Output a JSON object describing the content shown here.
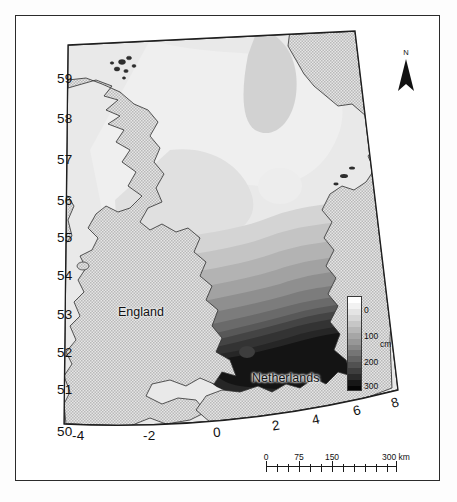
{
  "figure": {
    "type": "thematic-contour-map",
    "region": "North Sea"
  },
  "map": {
    "place_labels": [
      {
        "name": "England",
        "x": 118,
        "y": 305
      },
      {
        "name": "Netherlands",
        "x": 252,
        "y": 371
      }
    ],
    "latitude_label_text": "Latitude (degrees north)",
    "longitude_label_text": "Longitude (degrees east)",
    "latitude_ticks": [
      {
        "label": "59",
        "x": 57,
        "y": 71
      },
      {
        "label": "58",
        "x": 57,
        "y": 111
      },
      {
        "label": "57",
        "x": 57,
        "y": 152
      },
      {
        "label": "56",
        "x": 57,
        "y": 193
      },
      {
        "label": "55",
        "x": 57,
        "y": 230
      },
      {
        "label": "54",
        "x": 57,
        "y": 268
      },
      {
        "label": "53",
        "x": 57,
        "y": 307
      },
      {
        "label": "52",
        "x": 57,
        "y": 345
      },
      {
        "label": "51",
        "x": 57,
        "y": 382
      },
      {
        "label": "50",
        "x": 57,
        "y": 424
      }
    ],
    "longitude_ticks": [
      {
        "label": "-4",
        "x": 72,
        "y": 428,
        "rot": 0
      },
      {
        "label": "-2",
        "x": 143,
        "y": 428,
        "rot": 0
      },
      {
        "label": "0",
        "x": 213,
        "y": 425,
        "rot": -5
      },
      {
        "label": "2",
        "x": 272,
        "y": 418,
        "rot": -9
      },
      {
        "label": "4",
        "x": 312,
        "y": 412,
        "rot": -12
      },
      {
        "label": "6",
        "x": 353,
        "y": 403,
        "rot": -14
      },
      {
        "label": "8",
        "x": 391,
        "y": 395,
        "rot": -16
      }
    ]
  },
  "north_arrow": {
    "label": "N",
    "icon": "north-arrow-icon"
  },
  "legend": {
    "unit": "cm",
    "ticks": [
      {
        "label": "0",
        "top": 10
      },
      {
        "label": "100",
        "top": 36
      },
      {
        "label": "200",
        "top": 62
      },
      {
        "label": "300",
        "top": 86
      }
    ],
    "bands": [
      "#ffffff",
      "#f2f2f2",
      "#e4e4e4",
      "#d6d6d6",
      "#c6c6c6",
      "#b6b6b6",
      "#a6a6a6",
      "#979797",
      "#878787",
      "#757575",
      "#636363",
      "#515151",
      "#3e3e3e",
      "#2b2b2b",
      "#171717",
      "#060606"
    ],
    "value_min": 0,
    "value_max": 300
  },
  "scale_bar": {
    "unit": "km",
    "labels": [
      {
        "label": "0",
        "x": 0
      },
      {
        "label": "75",
        "x": 33
      },
      {
        "label": "150",
        "x": 66
      },
      {
        "label": "300 km",
        "x": 130
      }
    ],
    "major_ticks": [
      0,
      33,
      66,
      130
    ],
    "minor_ticks": [
      11,
      22,
      44,
      55,
      77,
      88,
      99,
      110,
      121
    ]
  },
  "chart_data": {
    "type": "heatmap",
    "title": "",
    "xlabel": "Longitude (degrees east)",
    "ylabel": "Latitude (degrees north)",
    "xlim": [
      -5,
      9
    ],
    "ylim": [
      49.8,
      59.6
    ],
    "xticks": [
      -4,
      -2,
      0,
      2,
      4,
      6,
      8
    ],
    "yticks": [
      50,
      51,
      52,
      53,
      54,
      55,
      56,
      57,
      58,
      59
    ],
    "colorbar_label": "cm",
    "colorbar_ticks": [
      0,
      100,
      200,
      300
    ],
    "colorbar_range": [
      -50,
      330
    ],
    "grid": false,
    "legend_position": "inside-right",
    "annotations": [
      "England",
      "Netherlands",
      "N"
    ],
    "contour_levels": [
      -50,
      0,
      25,
      50,
      75,
      100,
      125,
      150,
      175,
      200,
      225,
      250,
      275,
      300,
      330
    ]
  }
}
